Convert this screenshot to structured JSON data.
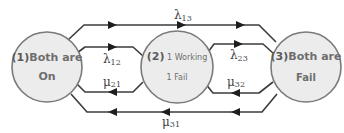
{
  "diagram": {
    "type": "state-transition",
    "states": [
      {
        "id": "1",
        "number_label": "(1)",
        "line1": "Both are",
        "line2": "On"
      },
      {
        "id": "2",
        "number_label": "(2)",
        "line1": " 1 Working",
        "line2": "1 Fail"
      },
      {
        "id": "3",
        "number_label": "(3)",
        "line1": "Both are",
        "line2": "Fail"
      }
    ],
    "transitions": [
      {
        "from": "1",
        "to": "3",
        "symbol": "λ",
        "sub": "13",
        "direction": "right"
      },
      {
        "from": "1",
        "to": "2",
        "symbol": "λ",
        "sub": "12",
        "direction": "right"
      },
      {
        "from": "2",
        "to": "1",
        "symbol": "μ",
        "sub": "21",
        "direction": "left"
      },
      {
        "from": "2",
        "to": "3",
        "symbol": "λ",
        "sub": "23",
        "direction": "right"
      },
      {
        "from": "3",
        "to": "2",
        "symbol": "μ",
        "sub": "32",
        "direction": "left"
      },
      {
        "from": "3",
        "to": "1",
        "symbol": "μ",
        "sub": "31",
        "direction": "left"
      }
    ],
    "colors": {
      "circle_fill": "#ececec",
      "circle_stroke": "#7a7a7a",
      "edge": "#3c3c3c",
      "text": "#6e6e6e"
    }
  }
}
